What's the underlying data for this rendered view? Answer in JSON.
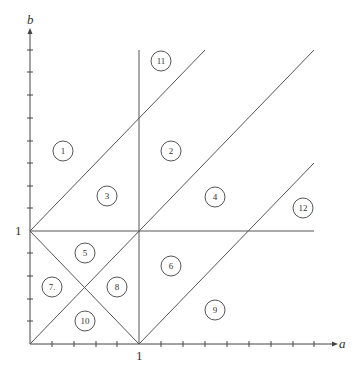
{
  "diagram": {
    "axes": {
      "x_label": "a",
      "y_label": "b",
      "x_unit_label": "1",
      "y_unit_label": "1"
    },
    "regions": [
      {
        "id": "1",
        "label": "1"
      },
      {
        "id": "2",
        "label": "2"
      },
      {
        "id": "3",
        "label": "3"
      },
      {
        "id": "4",
        "label": "4"
      },
      {
        "id": "5",
        "label": "5"
      },
      {
        "id": "6",
        "label": "6"
      },
      {
        "id": "7",
        "label": "7."
      },
      {
        "id": "8",
        "label": "8"
      },
      {
        "id": "9",
        "label": "9"
      },
      {
        "id": "10",
        "label": "10"
      },
      {
        "id": "11",
        "label": "11"
      },
      {
        "id": "12",
        "label": "12"
      }
    ],
    "lines": [
      "a = 1 (vertical)",
      "b = 1 (horizontal)",
      "b = a + 1",
      "b = a",
      "b = a - 1",
      "a + b = 1"
    ],
    "colors": {
      "line": "#555555",
      "background": "#ffffff"
    }
  }
}
